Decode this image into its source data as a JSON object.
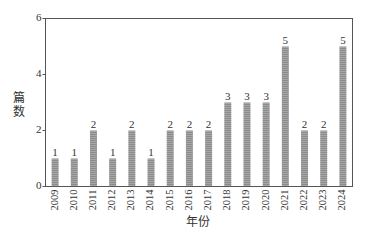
{
  "chart_data": {
    "type": "bar",
    "title": "",
    "xlabel": "年份",
    "ylabel": "篇数",
    "categories": [
      "2009",
      "2010",
      "2011",
      "2012",
      "2013",
      "2014",
      "2015",
      "2016",
      "2017",
      "2018",
      "2019",
      "2020",
      "2021",
      "2022",
      "2023",
      "2024"
    ],
    "values": [
      1,
      1,
      2,
      1,
      2,
      1,
      2,
      2,
      2,
      3,
      3,
      3,
      5,
      2,
      2,
      5
    ],
    "ylim": [
      0,
      6
    ],
    "yticks": [
      0,
      2,
      4,
      6
    ],
    "grid": false,
    "legend": null,
    "bar_color": "#8a8a8a",
    "bar_hatch": "horizontal",
    "data_labels": true,
    "xtick_rotation": 90
  }
}
